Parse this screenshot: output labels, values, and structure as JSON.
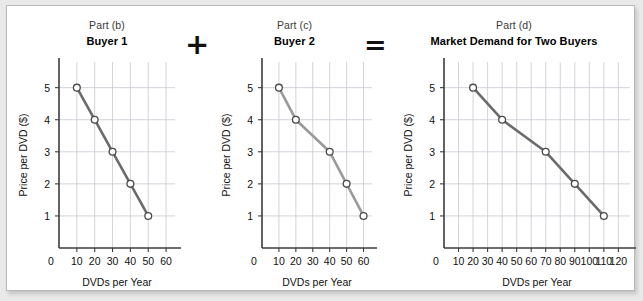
{
  "figure": {
    "background_color": "#e9e9e9",
    "card_color": "#ffffff"
  },
  "operators": {
    "plus": "+",
    "equals": "="
  },
  "panels": [
    {
      "key": "b",
      "part_label": "Part (b)",
      "title": "Buyer 1",
      "line_color": "#6b6b6b"
    },
    {
      "key": "c",
      "part_label": "Part (c)",
      "title": "Buyer 2",
      "line_color": "#9a9a9a"
    },
    {
      "key": "d",
      "part_label": "Part (d)",
      "title": "Market Demand for Two Buyers",
      "line_color": "#6b6b6b"
    }
  ],
  "chart_data": [
    {
      "type": "line",
      "title": "Buyer 1",
      "subtitle": "Part (b)",
      "xlabel": "DVDs per Year",
      "ylabel": "Price per DVD ($)",
      "x": [
        10,
        20,
        30,
        40,
        50
      ],
      "values": [
        5,
        4,
        3,
        2,
        1
      ],
      "xlim": [
        0,
        65
      ],
      "ylim": [
        0,
        5.8
      ],
      "xticks": [
        0,
        10,
        20,
        30,
        40,
        50,
        60
      ],
      "xticklabels": [
        "0",
        "10",
        "20",
        "30",
        "40",
        "50",
        "60"
      ],
      "yticks": [
        1,
        2,
        3,
        4,
        5
      ],
      "yticklabels": [
        "1",
        "2",
        "3",
        "4",
        "5"
      ],
      "grid": true,
      "legend": "none",
      "line_color": "#6b6b6b",
      "marker": "open-circle"
    },
    {
      "type": "line",
      "title": "Buyer 2",
      "subtitle": "Part (c)",
      "xlabel": "DVDs per Year",
      "ylabel": "Price per DVD ($)",
      "x": [
        10,
        20,
        40,
        50,
        60
      ],
      "values": [
        5,
        4,
        3,
        2,
        1
      ],
      "xlim": [
        0,
        65
      ],
      "ylim": [
        0,
        5.8
      ],
      "xticks": [
        0,
        10,
        20,
        30,
        40,
        50,
        60
      ],
      "xticklabels": [
        "0",
        "10",
        "20",
        "30",
        "40",
        "50",
        "60"
      ],
      "yticks": [
        1,
        2,
        3,
        4,
        5
      ],
      "yticklabels": [
        "1",
        "2",
        "3",
        "4",
        "5"
      ],
      "grid": true,
      "legend": "none",
      "line_color": "#9a9a9a",
      "marker": "open-circle"
    },
    {
      "type": "line",
      "title": "Market Demand for Two Buyers",
      "subtitle": "Part (d)",
      "xlabel": "DVDs per Year",
      "ylabel": "Price per DVD ($)",
      "x": [
        20,
        40,
        70,
        90,
        110
      ],
      "values": [
        5,
        4,
        3,
        2,
        1
      ],
      "xlim": [
        0,
        128
      ],
      "ylim": [
        0,
        5.8
      ],
      "xticks": [
        0,
        10,
        20,
        30,
        40,
        50,
        60,
        70,
        80,
        90,
        100,
        110,
        120
      ],
      "xticklabels": [
        "0",
        "10",
        "20",
        "30",
        "40",
        "50",
        "60",
        "70",
        "80",
        "90",
        "100",
        "110",
        "120"
      ],
      "yticks": [
        1,
        2,
        3,
        4,
        5
      ],
      "yticklabels": [
        "1",
        "2",
        "3",
        "4",
        "5"
      ],
      "grid": true,
      "legend": "none",
      "line_color": "#6b6b6b",
      "marker": "open-circle"
    }
  ]
}
